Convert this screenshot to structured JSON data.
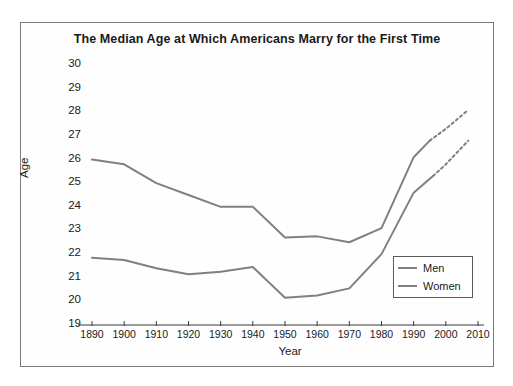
{
  "chart_data": {
    "type": "line",
    "title": "The Median Age at Which Americans Marry for the First Time",
    "xlabel": "Year",
    "ylabel": "Age",
    "xlim": [
      1890,
      2010
    ],
    "ylim": [
      19,
      30
    ],
    "grid": false,
    "legend_position": "bottom-right",
    "xticks": [
      1890,
      1900,
      1910,
      1920,
      1930,
      1940,
      1950,
      1960,
      1970,
      1980,
      1990,
      2000,
      2010
    ],
    "yticks": [
      19,
      20,
      21,
      22,
      23,
      24,
      25,
      26,
      27,
      28,
      29,
      30
    ],
    "line_color": "#808080",
    "series": [
      {
        "name": "Men",
        "color": "#808080",
        "solid": {
          "x": [
            1890,
            1900,
            1910,
            1920,
            1930,
            1940,
            1950,
            1960,
            1970,
            1980,
            1990,
            1995
          ],
          "y": [
            26.0,
            25.8,
            25.0,
            24.5,
            24.0,
            24.0,
            22.7,
            22.75,
            22.5,
            23.1,
            26.1,
            26.8
          ]
        },
        "dashed": {
          "x": [
            1995,
            2000,
            2007
          ],
          "y": [
            26.8,
            27.3,
            28.1
          ]
        }
      },
      {
        "name": "Women",
        "color": "#808080",
        "solid": {
          "x": [
            1890,
            1900,
            1910,
            1920,
            1930,
            1940,
            1950,
            1960,
            1970,
            1980,
            1990,
            1996
          ],
          "y": [
            21.85,
            21.75,
            21.4,
            21.15,
            21.25,
            21.45,
            20.15,
            20.25,
            20.55,
            22.0,
            24.6,
            25.3
          ]
        },
        "dashed": {
          "x": [
            1996,
            2000,
            2007
          ],
          "y": [
            25.3,
            25.8,
            26.8
          ]
        }
      }
    ]
  },
  "legend": {
    "items": [
      {
        "label": "Men"
      },
      {
        "label": "Women"
      }
    ]
  }
}
